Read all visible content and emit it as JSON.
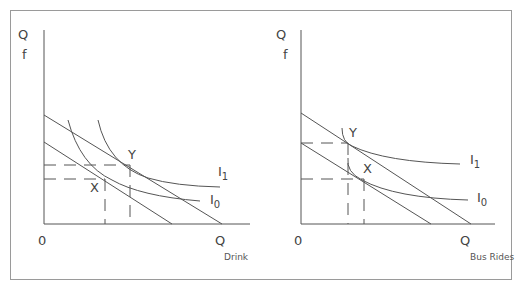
{
  "caption": "",
  "left_panel": {
    "y_axis_label": "Q",
    "y_axis_sub": "f",
    "origin": "0",
    "x_axis_label": "Q",
    "x_axis_sub": "Drink",
    "point_x": "X",
    "point_y": "Y",
    "curve_i1": "I",
    "curve_i1_sub": "1",
    "curve_i0": "I",
    "curve_i0_sub": "0"
  },
  "right_panel": {
    "y_axis_label": "Q",
    "y_axis_sub": "f",
    "origin": "0",
    "x_axis_label": "Q",
    "x_axis_sub": "Bus Rides",
    "point_x": "X",
    "point_y": "Y",
    "curve_i1": "I",
    "curve_i1_sub": "1",
    "curve_i0": "I",
    "curve_i0_sub": "0"
  },
  "colors": {
    "line": "#555555",
    "frame": "#9a9a9a"
  }
}
